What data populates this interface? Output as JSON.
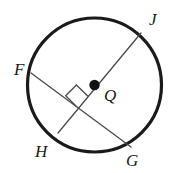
{
  "figure": {
    "name": "circle-with-perpendicular-chords",
    "background_color": "#ffffff",
    "stroke_color": "#1a1a1a",
    "chord_color": "#4a4a4a",
    "circle": {
      "center_label": "Q",
      "center_x": 94.5,
      "center_y": 85,
      "radius": 67,
      "stroke_width": 3.2
    },
    "center_point": {
      "label": "Q",
      "x": 94.5,
      "y": 85,
      "dot_radius": 5.2,
      "label_x": 104,
      "label_y": 87
    },
    "segments": [
      {
        "name": "chord-FG",
        "from": "F",
        "to": "G",
        "x1": 31,
        "y1": 73,
        "x2": 131,
        "y2": 147,
        "stroke_width": 1.3
      },
      {
        "name": "diameter-HJ",
        "from": "H",
        "to": "J",
        "x1": 58,
        "y1": 133,
        "x2": 141,
        "y2": 33,
        "stroke_width": 1.3
      }
    ],
    "right_angle_marker": {
      "name": "right-angle-square",
      "vertex_x": 77,
      "vertex_y": 107,
      "size": 16,
      "stroke_width": 1.3,
      "points": "77,107 65.7,95.7 76.4,85 88,96.2"
    },
    "labels": [
      {
        "id": "F",
        "text": "F",
        "x": 14,
        "y": 61
      },
      {
        "id": "J",
        "text": "J",
        "x": 149,
        "y": 11
      },
      {
        "id": "H",
        "text": "H",
        "x": 35,
        "y": 143
      },
      {
        "id": "G",
        "text": "G",
        "x": 126,
        "y": 152
      }
    ]
  }
}
